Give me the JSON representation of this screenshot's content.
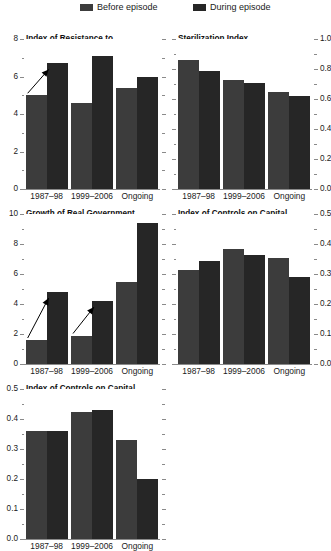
{
  "legend": {
    "entries": [
      {
        "label": "Before episode",
        "color": "#3c3c3c"
      },
      {
        "label": "During episode",
        "color": "#262626"
      }
    ]
  },
  "colors": {
    "before": "#3c3c3c",
    "during": "#262626",
    "axis": "#8a8a8a",
    "text": "#1a1a1a"
  },
  "categories": [
    "1987–98",
    "1999–2006",
    "Ongoing"
  ],
  "chart_data": [
    {
      "id": "resistance",
      "type": "bar",
      "title": "Index of Resistance to Exchange Market Pressures",
      "title_lines": [
        "Index of Resistance to",
        "Exchange Market Pressures"
      ],
      "categories": [
        "1987–98",
        "1999–2006",
        "Ongoing"
      ],
      "series": [
        {
          "name": "Before episode",
          "values": [
            5.0,
            4.6,
            5.4
          ]
        },
        {
          "name": "During episode",
          "values": [
            6.7,
            7.1,
            6.0
          ]
        }
      ],
      "ylim": [
        0,
        8
      ],
      "yticks": [
        0,
        2,
        4,
        6,
        8
      ],
      "ytick_labels": [
        "0",
        "2",
        "4",
        "6",
        "8"
      ],
      "minor_ticks": [
        1,
        3,
        5,
        7
      ],
      "axis_side": "left",
      "xlabel": "",
      "ylabel": "",
      "grid": false,
      "annotations": [
        {
          "type": "arrow",
          "from_category": "1987–98",
          "note": "increase from before to during"
        }
      ]
    },
    {
      "id": "sterilization",
      "type": "bar",
      "title": "Sterilization Index",
      "title_lines": [
        "Sterilization Index"
      ],
      "categories": [
        "1987–98",
        "1999–2006",
        "Ongoing"
      ],
      "series": [
        {
          "name": "Before episode",
          "values": [
            0.86,
            0.73,
            0.65
          ]
        },
        {
          "name": "During episode",
          "values": [
            0.79,
            0.71,
            0.62
          ]
        }
      ],
      "ylim": [
        0.0,
        1.0
      ],
      "yticks": [
        0.0,
        0.2,
        0.4,
        0.6,
        0.8,
        1.0
      ],
      "ytick_labels": [
        "0.0",
        "0.2",
        "0.4",
        "0.6",
        "0.8",
        "1.0"
      ],
      "minor_ticks": [
        0.1,
        0.3,
        0.5,
        0.7,
        0.9
      ],
      "axis_side": "right",
      "xlabel": "",
      "ylabel": "",
      "grid": false,
      "annotations": []
    },
    {
      "id": "govt-expenditure",
      "type": "bar",
      "title": "Growth of Real Government Expenditure (percent)",
      "title_lines": [
        "Growth of Real Government",
        "Expenditure",
        "(percent)"
      ],
      "categories": [
        "1987–98",
        "1999–2006",
        "Ongoing"
      ],
      "series": [
        {
          "name": "Before episode",
          "values": [
            1.6,
            1.9,
            5.5
          ]
        },
        {
          "name": "During episode",
          "values": [
            4.8,
            4.2,
            9.4
          ]
        }
      ],
      "ylim": [
        0,
        10
      ],
      "yticks": [
        0,
        2,
        4,
        6,
        8,
        10
      ],
      "ytick_labels": [
        "0",
        "2",
        "4",
        "6",
        "8",
        "10"
      ],
      "minor_ticks": [
        1,
        3,
        5,
        7,
        9
      ],
      "axis_side": "left",
      "xlabel": "",
      "ylabel": "percent",
      "grid": false,
      "annotations": [
        {
          "type": "arrow",
          "from_category": "1987–98",
          "note": "increase from before to during"
        },
        {
          "type": "arrow",
          "from_category": "1999–2006",
          "note": "increase from before to during"
        }
      ]
    },
    {
      "id": "controls-inflows",
      "type": "bar",
      "title": "Index of Controls on Capital Inflows",
      "title_lines": [
        "Index of Controls on Capital",
        "Inflows"
      ],
      "categories": [
        "1987–98",
        "1999–2006",
        "Ongoing"
      ],
      "series": [
        {
          "name": "Before episode",
          "values": [
            0.315,
            0.385,
            0.355
          ]
        },
        {
          "name": "During episode",
          "values": [
            0.345,
            0.365,
            0.29
          ]
        }
      ],
      "ylim": [
        0.0,
        0.5
      ],
      "yticks": [
        0.0,
        0.1,
        0.2,
        0.3,
        0.4,
        0.5
      ],
      "ytick_labels": [
        "0.0",
        "0.1",
        "0.2",
        "0.3",
        "0.4",
        "0.5"
      ],
      "minor_ticks": [
        0.05,
        0.15,
        0.25,
        0.35,
        0.45
      ],
      "axis_side": "right",
      "xlabel": "",
      "ylabel": "",
      "grid": false,
      "annotations": []
    },
    {
      "id": "controls-outflows",
      "type": "bar",
      "title": "Index of Controls on Capital Outflows",
      "title_lines": [
        "Index of Controls on Capital",
        "Outflows"
      ],
      "categories": [
        "1987–98",
        "1999–2006",
        "Ongoing"
      ],
      "series": [
        {
          "name": "Before episode",
          "values": [
            0.36,
            0.425,
            0.33
          ]
        },
        {
          "name": "During episode",
          "values": [
            0.36,
            0.43,
            0.2
          ]
        }
      ],
      "ylim": [
        0.0,
        0.5
      ],
      "yticks": [
        0.0,
        0.1,
        0.2,
        0.3,
        0.4,
        0.5
      ],
      "ytick_labels": [
        "0.0",
        "0.1",
        "0.2",
        "0.3",
        "0.4",
        "0.5"
      ],
      "minor_ticks": [
        0.05,
        0.15,
        0.25,
        0.35,
        0.45
      ],
      "axis_side": "left",
      "xlabel": "",
      "ylabel": "",
      "grid": false,
      "annotations": [],
      "xlabels_clipped": true
    }
  ]
}
